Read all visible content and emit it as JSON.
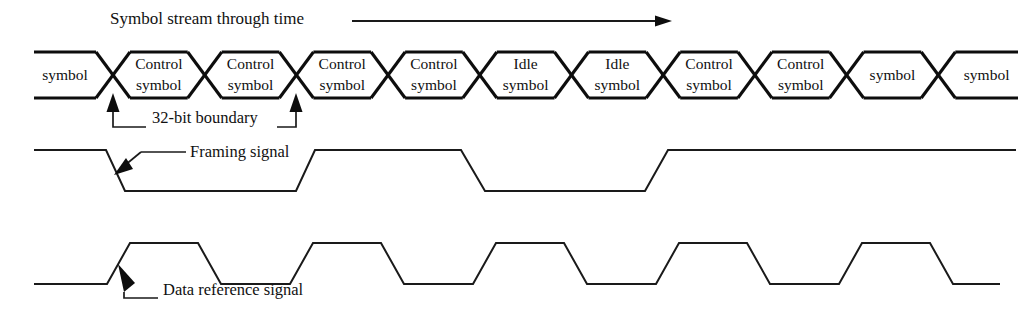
{
  "diagram": {
    "title": "Symbol stream through time",
    "title_arrow": "right-arrow",
    "annotations": {
      "boundary": "32-bit boundary",
      "framing": "Framing signal",
      "data_reference": "Data reference signal"
    },
    "stream": {
      "cells": [
        {
          "index": 0,
          "line1": "symbol",
          "line2": "",
          "type": "data",
          "clipped_left": true
        },
        {
          "index": 1,
          "line1": "Control",
          "line2": "symbol",
          "type": "control",
          "clipped_left": false
        },
        {
          "index": 2,
          "line1": "Control",
          "line2": "symbol",
          "type": "control",
          "clipped_left": false
        },
        {
          "index": 3,
          "line1": "Control",
          "line2": "symbol",
          "type": "control",
          "clipped_left": false
        },
        {
          "index": 4,
          "line1": "Control",
          "line2": "symbol",
          "type": "control",
          "clipped_left": false
        },
        {
          "index": 5,
          "line1": "Idle",
          "line2": "symbol",
          "type": "idle",
          "clipped_left": false
        },
        {
          "index": 6,
          "line1": "Idle",
          "line2": "symbol",
          "type": "idle",
          "clipped_left": false
        },
        {
          "index": 7,
          "line1": "Control",
          "line2": "symbol",
          "type": "control",
          "clipped_left": false
        },
        {
          "index": 8,
          "line1": "Control",
          "line2": "symbol",
          "type": "control",
          "clipped_left": false
        },
        {
          "index": 9,
          "line1": "symbol",
          "line2": "",
          "type": "data",
          "clipped_left": false
        },
        {
          "index": 10,
          "line1": "symbol",
          "line2": "",
          "type": "data",
          "clipped_right": true
        }
      ],
      "boundary_markers": [
        {
          "label": "32-bit boundary",
          "x": 113
        },
        {
          "label": "32-bit boundary",
          "x": 296
        }
      ]
    },
    "waveforms": [
      {
        "name": "Framing signal",
        "levels": [
          "high",
          "low",
          "high",
          "low",
          "high"
        ],
        "transitions": [
          "fall",
          "rise",
          "fall",
          "rise"
        ]
      },
      {
        "name": "Data reference signal",
        "levels": [
          "low",
          "high",
          "low",
          "high",
          "low",
          "high",
          "low",
          "high",
          "low",
          "high",
          "low"
        ],
        "pulse_count": 5
      }
    ],
    "colors": {
      "ink": "#0d0d0d",
      "line": "#1a1a1a",
      "background": "#ffffff"
    }
  }
}
